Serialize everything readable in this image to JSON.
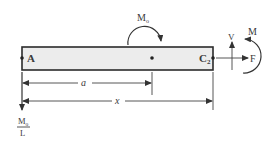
{
  "diagram": {
    "type": "beam free-body diagram",
    "beam": {
      "left_label": "A",
      "right_label_base": "C",
      "right_label_sub": "2",
      "fill_color": "#ececec",
      "edge_color": "#2b2b2b"
    },
    "applied_moment": {
      "label_base": "M",
      "label_sub": "o",
      "direction": "clockwise"
    },
    "distributed_reaction": {
      "numerator_base": "M",
      "numerator_sub": "o",
      "denominator": "L",
      "direction": "down"
    },
    "dimensions": {
      "a_label": "a",
      "x_label": "x"
    },
    "internal_forces": {
      "shear_label": "V",
      "axial_label": "F",
      "moment_label": "M",
      "moment_direction": "counterclockwise"
    }
  }
}
